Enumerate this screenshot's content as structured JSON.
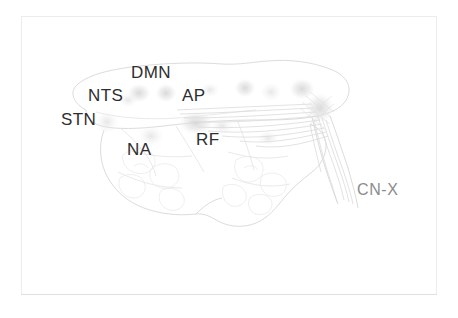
{
  "figure": {
    "kind": "anatomical-line-drawing",
    "background_color": "#ffffff",
    "frame_color": "#ececec",
    "label_color": "#2e2e2e",
    "faint_label_color": "#8c8c8c",
    "drawing_stroke_color": "#dfdfdf"
  },
  "labels": {
    "dmn": "DMN",
    "nts": "NTS",
    "ap": "AP",
    "stn": "STN",
    "rf": "RF",
    "na": "NA",
    "cn_x": "CN-X"
  },
  "label_list": [
    {
      "id": "dmn",
      "text": "DMN",
      "x": 131,
      "y": 64,
      "tone": "dark"
    },
    {
      "id": "nts",
      "text": "NTS",
      "x": 88,
      "y": 87,
      "tone": "dark"
    },
    {
      "id": "ap",
      "text": "AP",
      "x": 182,
      "y": 87,
      "tone": "dark"
    },
    {
      "id": "stn",
      "text": "STN",
      "x": 61,
      "y": 111,
      "tone": "dark"
    },
    {
      "id": "rf",
      "text": "RF",
      "x": 196,
      "y": 131,
      "tone": "dark"
    },
    {
      "id": "na",
      "text": "NA",
      "x": 127,
      "y": 141,
      "tone": "dark"
    },
    {
      "id": "cn_x",
      "text": "CN-X",
      "x": 357,
      "y": 182,
      "tone": "faint"
    }
  ]
}
